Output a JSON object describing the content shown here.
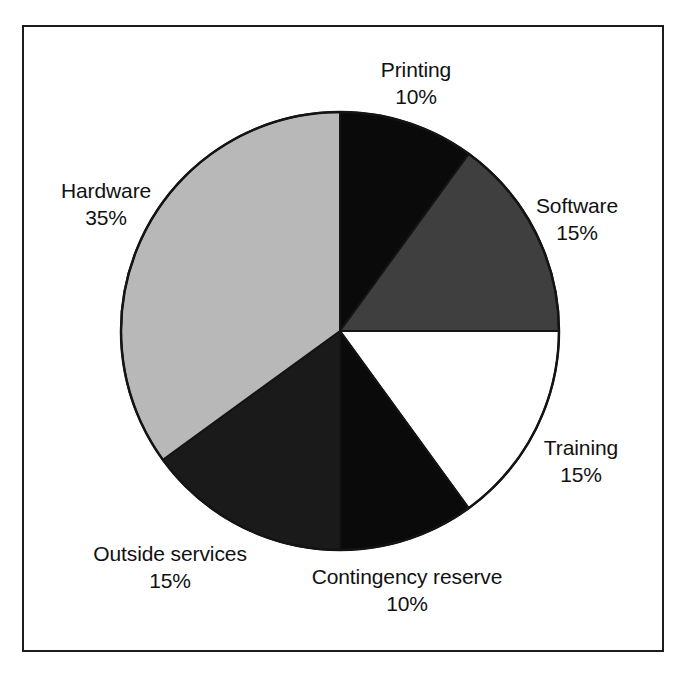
{
  "figure": {
    "background_color": "#ffffff",
    "frame_color": "#1c1c1c",
    "text_color": "#111111"
  },
  "chart_data": {
    "type": "pie",
    "title": "",
    "subtitle": "",
    "xlabel": "",
    "ylabel": "",
    "legend_position": "none",
    "grid": false,
    "start_angle_deg": 0,
    "direction": "clockwise",
    "units": "percent",
    "total": 100,
    "categories": [
      "Printing",
      "Software",
      "Training",
      "Contingency reserve",
      "Outside services",
      "Hardware"
    ],
    "values": [
      10,
      15,
      15,
      10,
      15,
      35
    ],
    "value_labels": [
      "10%",
      "15%",
      "15%",
      "10%",
      "15%",
      "35%"
    ],
    "colors": [
      "#0a0a0a",
      "#3f3f3f",
      "#ffffff",
      "#0a0a0a",
      "#1a1a1a",
      "#b8b8b8"
    ],
    "slices": [
      {
        "id": "printing",
        "label": "Printing",
        "value": 10,
        "value_label": "10%",
        "fill": "#0a0a0a",
        "start_deg": 0,
        "end_deg": 36
      },
      {
        "id": "software",
        "label": "Software",
        "value": 15,
        "value_label": "15%",
        "fill": "#3f3f3f",
        "start_deg": 36,
        "end_deg": 90
      },
      {
        "id": "training",
        "label": "Training",
        "value": 15,
        "value_label": "15%",
        "fill": "#ffffff",
        "start_deg": 90,
        "end_deg": 144
      },
      {
        "id": "contingency-reserve",
        "label": "Contingency reserve",
        "value": 10,
        "value_label": "10%",
        "fill": "#0a0a0a",
        "start_deg": 144,
        "end_deg": 180
      },
      {
        "id": "outside-services",
        "label": "Outside services",
        "value": 15,
        "value_label": "15%",
        "fill": "#1a1a1a",
        "start_deg": 180,
        "end_deg": 234
      },
      {
        "id": "hardware",
        "label": "Hardware",
        "value": 35,
        "value_label": "35%",
        "fill": "#b8b8b8",
        "start_deg": 234,
        "end_deg": 360
      }
    ]
  }
}
